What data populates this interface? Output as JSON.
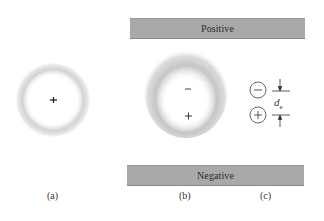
{
  "figure": {
    "plates": {
      "positive_label": "Positive",
      "negative_label": "Negative",
      "color": "#a9a9a9"
    },
    "panel_a": {
      "caption": "(a)",
      "description": "Unpolarized atom: symmetric electron cloud centered on nucleus",
      "nucleus_symbol": "+"
    },
    "panel_b": {
      "caption": "(b)",
      "description": "Polarized atom between charged plates: electron cloud displaced toward positive plate",
      "negative_center_symbol": "−",
      "positive_center_symbol": "+"
    },
    "panel_c": {
      "caption": "(c)",
      "description": "Equivalent electric dipole",
      "negative_charge_symbol": "−",
      "positive_charge_symbol": "+",
      "separation_label": "d",
      "separation_subscript": "e"
    }
  }
}
